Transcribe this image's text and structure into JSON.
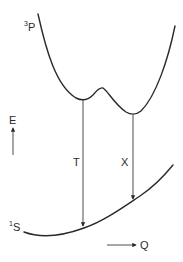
{
  "diagram": {
    "upper_state": {
      "label_sup": "3",
      "label_main": "P"
    },
    "ground_state": {
      "label_sup": "1",
      "label_main": "S"
    },
    "transitions": [
      {
        "label": "T"
      },
      {
        "label": "X"
      }
    ],
    "axes": {
      "energy_label": "E",
      "coordinate_label": "Q"
    },
    "colors": {
      "ink": "#2a2a2a",
      "background": "#ffffff"
    }
  }
}
